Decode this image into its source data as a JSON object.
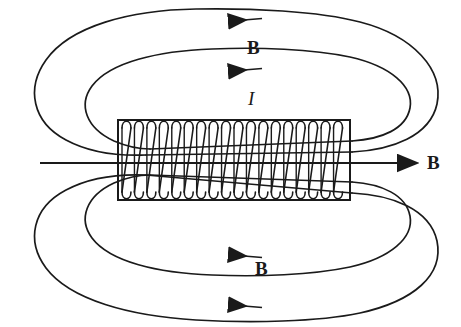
{
  "figure": {
    "kind": "physics-diagram",
    "background_color": "#ffffff",
    "stroke_color": "#1a1a1a"
  },
  "labels": {
    "b_top": "B",
    "b_right": "B",
    "b_bottom": "B",
    "current": "I"
  },
  "solenoid": {
    "x": 118,
    "y": 120,
    "width": 232,
    "height": 80,
    "coil_turns": 18,
    "coil_color": "#1a1a1a"
  },
  "axis": {
    "y": 163,
    "x_start": 40,
    "x_end": 414,
    "arrow_direction": "right"
  },
  "field_loops": {
    "top": [
      {
        "name": "outer",
        "arrow_x": 245,
        "arrow_y": 20,
        "direction": "left"
      },
      {
        "name": "inner",
        "arrow_x": 245,
        "arrow_y": 70,
        "direction": "left"
      }
    ],
    "bottom": [
      {
        "name": "inner",
        "arrow_x": 245,
        "arrow_y": 256,
        "direction": "left"
      },
      {
        "name": "outer",
        "arrow_x": 245,
        "arrow_y": 306,
        "direction": "left"
      }
    ]
  }
}
